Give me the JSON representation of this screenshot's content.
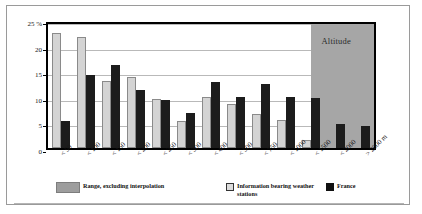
{
  "chart_data": {
    "type": "bar",
    "title": "",
    "subtitle": "",
    "xlabel": "",
    "ylabel": "",
    "ylim": [
      0,
      25
    ],
    "yticks": [
      0,
      5,
      10,
      15,
      20,
      25
    ],
    "ytick_labels": [
      "0",
      "5",
      "10",
      "15",
      "20",
      "25 %"
    ],
    "grid": true,
    "legend_position": "bottom",
    "categories": [
      "< 50",
      "< 100",
      "< 150",
      "< 200",
      "< 250",
      "< 300",
      "< 400",
      "< 500",
      "< 750",
      "< 1000",
      "< 1500",
      "< 2000",
      "> 2000 m"
    ],
    "series": [
      {
        "name": "Information bearing weather stations",
        "color": "#d4d4d4",
        "values": [
          22.1,
          21.3,
          12.7,
          13.4,
          9.2,
          4.8,
          9.6,
          8.2,
          6.3,
          5.0,
          1.2,
          0.0,
          0.0
        ]
      },
      {
        "name": "France",
        "color": "#1c1c1c",
        "values": [
          4.8,
          13.8,
          15.8,
          11.0,
          8.9,
          6.4,
          12.6,
          9.6,
          12.2,
          9.6,
          9.4,
          4.3,
          3.9
        ]
      }
    ],
    "annotations": [
      {
        "text": "Altitude",
        "region": "shaded-band-right",
        "color": "#a6a6a6"
      }
    ]
  },
  "annotation": {
    "altitude_label": "Altitude"
  },
  "axis": {
    "y_unit_label": "25 %"
  },
  "legend": {
    "items": [
      {
        "label": "Range, excluding interpolation",
        "swatch": "range-swatch"
      },
      {
        "label": "Information bearing weather stations",
        "swatch": "light-swatch"
      },
      {
        "label": "France",
        "swatch": "dark-swatch"
      }
    ]
  }
}
